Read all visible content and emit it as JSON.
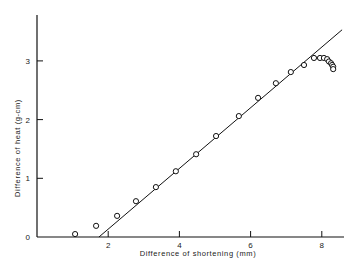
{
  "chart_data": {
    "type": "scatter",
    "title": "",
    "xlabel": "Difference of shortening (mm)",
    "ylabel": "Difference of heat (g-cm)",
    "xlim": [
      0,
      8.6
    ],
    "ylim": [
      0,
      3.8
    ],
    "xticks": [
      2,
      4,
      6,
      8
    ],
    "yticks": [
      0,
      1,
      2,
      3
    ],
    "grid": false,
    "legend": null,
    "series": [
      {
        "name": "measurements",
        "marker": "open-circle",
        "points": [
          [
            1.07,
            0.05
          ],
          [
            1.66,
            0.19
          ],
          [
            2.25,
            0.36
          ],
          [
            2.78,
            0.61
          ],
          [
            3.34,
            0.85
          ],
          [
            3.9,
            1.12
          ],
          [
            4.47,
            1.41
          ],
          [
            5.03,
            1.72
          ],
          [
            5.67,
            2.06
          ],
          [
            6.21,
            2.37
          ],
          [
            6.71,
            2.62
          ],
          [
            7.13,
            2.81
          ],
          [
            7.5,
            2.93
          ],
          [
            7.78,
            3.05
          ],
          [
            7.95,
            3.05
          ],
          [
            8.06,
            3.05
          ],
          [
            8.15,
            3.03
          ],
          [
            8.2,
            2.99
          ],
          [
            8.26,
            2.96
          ],
          [
            8.29,
            2.93
          ],
          [
            8.32,
            2.9
          ],
          [
            8.32,
            2.86
          ]
        ]
      },
      {
        "name": "fit-line",
        "type": "line",
        "points": [
          [
            1.74,
            0.0
          ],
          [
            8.57,
            3.53
          ]
        ]
      }
    ]
  },
  "axes": {
    "x_tick_labels": [
      "2",
      "4",
      "6",
      "8"
    ],
    "y_tick_labels": [
      "0",
      "1",
      "2",
      "3"
    ]
  }
}
